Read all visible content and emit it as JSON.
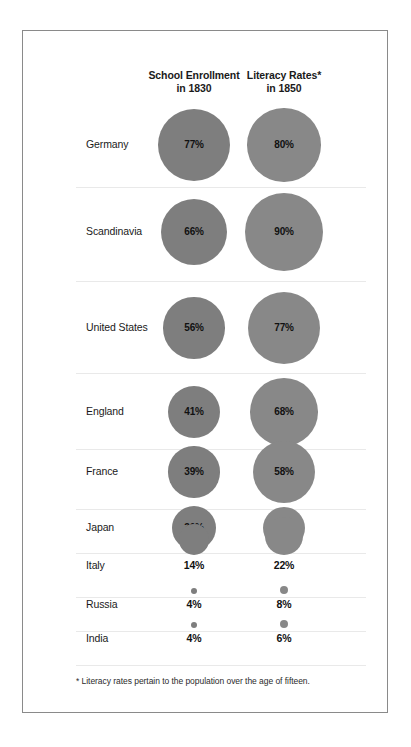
{
  "chart_data": {
    "type": "bar",
    "title": "",
    "subtitle": "",
    "xlabel": "",
    "ylabel": "",
    "grid": false,
    "legend_position": "none",
    "note": "Bubble/proportional-area chart: circle area scales with the percentage value.",
    "columns": [
      {
        "key": "enrollment",
        "label_line1": "School Enrollment",
        "label_line2": "in 1830",
        "color": "#7e7e7e"
      },
      {
        "key": "literacy",
        "label_line1": "Literacy Rates*",
        "label_line2": "in 1850",
        "color": "#888888"
      }
    ],
    "categories": [
      "Germany",
      "Scandinavia",
      "United States",
      "England",
      "France",
      "Japan",
      "Italy",
      "Russia",
      "India"
    ],
    "series": [
      {
        "name": "School Enrollment in 1830",
        "values": [
          77,
          66,
          56,
          41,
          39,
          30,
          14,
          4,
          4
        ]
      },
      {
        "name": "Literacy Rates in 1850",
        "values": [
          80,
          90,
          77,
          68,
          58,
          26,
          22,
          8,
          6
        ]
      }
    ],
    "value_labels": {
      "enrollment": [
        "77%",
        "66%",
        "56%",
        "41%",
        "39%",
        "30%",
        "14%",
        "4%",
        "4%"
      ],
      "literacy": [
        "80%",
        "90%",
        "77%",
        "68%",
        "58%",
        "26%",
        "22%",
        "8%",
        "6%"
      ]
    },
    "annotations": [
      "* Literacy rates pertain to the population over the age of fifteen."
    ]
  },
  "rows": [
    {
      "country": "Germany",
      "enrollment": "77%",
      "literacy": "80%"
    },
    {
      "country": "Scandinavia",
      "enrollment": "66%",
      "literacy": "90%"
    },
    {
      "country": "United States",
      "enrollment": "56%",
      "literacy": "77%"
    },
    {
      "country": "England",
      "enrollment": "41%",
      "literacy": "68%"
    },
    {
      "country": "France",
      "enrollment": "39%",
      "literacy": "58%"
    },
    {
      "country": "Japan",
      "enrollment": "30%",
      "literacy": "26%"
    },
    {
      "country": "Italy",
      "enrollment": "14%",
      "literacy": "22%"
    },
    {
      "country": "Russia",
      "enrollment": "4%",
      "literacy": "8%"
    },
    {
      "country": "India",
      "enrollment": "4%",
      "literacy": "6%"
    }
  ],
  "headers": {
    "enrollment_line1": "School Enrollment",
    "enrollment_line2": "in 1830",
    "literacy_line1": "Literacy Rates*",
    "literacy_line2": "in 1850"
  },
  "footnote": "* Literacy rates pertain to the population over the age of fifteen.",
  "colors": {
    "bubble_left": "#7e7e7e",
    "bubble_right": "#888888",
    "frame_border": "#8a8a8a",
    "divider": "#e9e9e9",
    "text": "#1a1a1a",
    "background": "#ffffff"
  }
}
